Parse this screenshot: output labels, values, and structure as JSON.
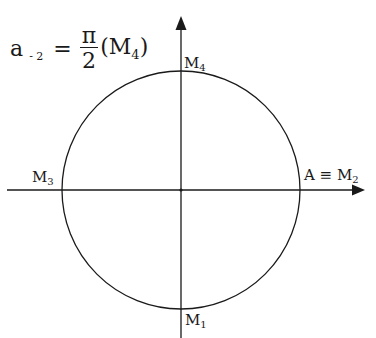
{
  "formula": {
    "lhs": "a",
    "lhs_subscript": "- 2",
    "equals": "=",
    "numerator": "π",
    "denominator": "2",
    "point_open": "(M",
    "point_subscript": "4",
    "point_close": ")"
  },
  "points": {
    "top": {
      "name": "M",
      "sub": "4"
    },
    "left": {
      "name": "M",
      "sub": "3"
    },
    "right": {
      "name": "A ≡ M",
      "sub": "2"
    },
    "bottom": {
      "name": "M",
      "sub": "1"
    }
  },
  "diagram": {
    "type": "unit-circle",
    "center": [
      181,
      190
    ],
    "radius": 119,
    "stroke_color": "#1a1a1a",
    "axes": {
      "x": {
        "from": [
          7,
          190
        ],
        "to": [
          364,
          190
        ],
        "arrow": true
      },
      "y": {
        "from": [
          181,
          338
        ],
        "to": [
          181,
          17
        ],
        "arrow": true
      }
    }
  }
}
